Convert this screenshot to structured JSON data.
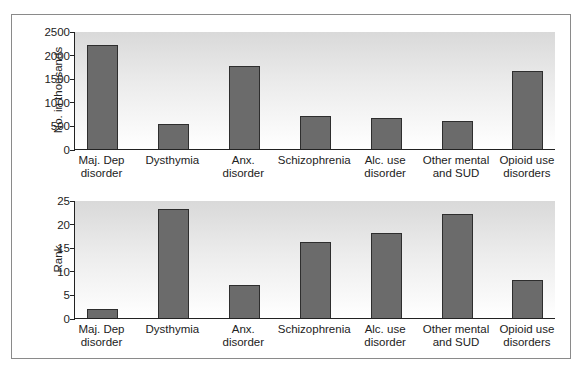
{
  "chart_data": [
    {
      "type": "bar",
      "title": "",
      "xlabel": "",
      "ylabel": "No. in thousands",
      "ylim": [
        0,
        2500
      ],
      "yticks": [
        0,
        500,
        1000,
        1500,
        2000,
        2500
      ],
      "categories": [
        "Maj. Dep disorder",
        "Dysthymia",
        "Anx. disorder",
        "Schizophrenia",
        "Alc. use disorder",
        "Other mental and SUD",
        "Opioid use disorders"
      ],
      "values": [
        2200,
        530,
        1750,
        700,
        650,
        590,
        1650
      ],
      "grid": false,
      "legend": null
    },
    {
      "type": "bar",
      "title": "",
      "xlabel": "",
      "ylabel": "Rank",
      "ylim": [
        0,
        25
      ],
      "yticks": [
        0,
        5,
        10,
        15,
        20,
        25
      ],
      "categories": [
        "Maj. Dep disorder",
        "Dysthymia",
        "Anx. disorder",
        "Schizophrenia",
        "Alc. use disorder",
        "Other mental and SUD",
        "Opioid use disorders"
      ],
      "values": [
        2,
        23,
        7,
        16,
        18,
        22,
        8
      ],
      "grid": false,
      "legend": null
    }
  ],
  "labels": {
    "top_ylabel": "No. in thousands",
    "bottom_ylabel": "Rank",
    "categories_line1": [
      "Maj. Dep",
      "Dysthymia",
      "Anx.",
      "Schizophrenia",
      "Alc. use",
      "Other mental",
      "Opioid use"
    ],
    "categories_line2": [
      "disorder",
      "",
      "disorder",
      "",
      "disorder",
      "and SUD",
      "disorders"
    ],
    "top_ticks": [
      "0",
      "500",
      "1000",
      "1500",
      "2000",
      "2500"
    ],
    "bottom_ticks": [
      "0",
      "5",
      "10",
      "15",
      "20",
      "25"
    ]
  },
  "colors": {
    "bar_fill": "#6b6b6b",
    "bar_outline": "#2e2e2e",
    "plot_bg_top": "#d9d9d9",
    "plot_bg_bottom": "#ffffff",
    "frame": "#8a8a8a"
  }
}
